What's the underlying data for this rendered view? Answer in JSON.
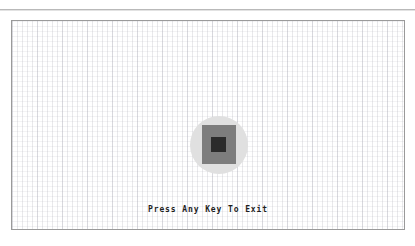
{
  "window": {
    "background_color": "#ffffff",
    "top_rule_color": "#b9b9b9"
  },
  "canvas": {
    "border_color": "#9a9a9a",
    "background_color": "#ffffff",
    "grid": {
      "visible": true,
      "cell_size_px": 5,
      "line_color": "#aaaab4",
      "major_cell_size_px": 25
    }
  },
  "graphic": {
    "name": "nested-shapes",
    "shapes": [
      {
        "kind": "circle",
        "color": "#e0e0e0",
        "diameter_px": 58
      },
      {
        "kind": "square",
        "color": "#7d7d7d",
        "width_px": 34,
        "height_px": 39
      },
      {
        "kind": "square",
        "color": "#2b2b2b",
        "width_px": 15,
        "height_px": 15
      }
    ]
  },
  "prompt": {
    "text": "Press Any Key To Exit"
  }
}
